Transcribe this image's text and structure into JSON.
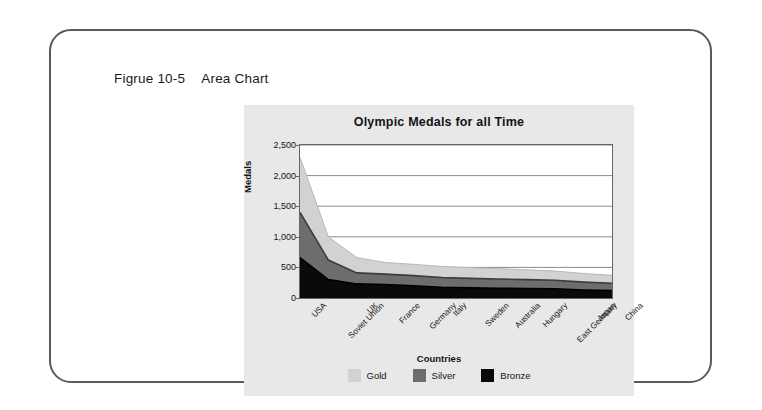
{
  "figure": {
    "caption_number": "Figrue 10-5",
    "caption_text": "Area Chart"
  },
  "colors": {
    "gold": "#d2d2d2",
    "silver": "#6d6d6d",
    "bronze": "#0a0a0a",
    "panel_bg": "#e8e8e8",
    "plot_bg": "#ffffff",
    "axis": "#666666",
    "frame": "#5a5a5a"
  },
  "chart_data": {
    "type": "area",
    "stacked": true,
    "title": "Olympic Medals for all Time",
    "xlabel": "Countries",
    "ylabel": "Medals",
    "ylim": [
      0,
      2500
    ],
    "yticks": [
      0,
      500,
      1000,
      1500,
      2000,
      2500
    ],
    "ytick_labels": [
      "0",
      "500",
      "1,000",
      "1,500",
      "2,000",
      "2,500"
    ],
    "grid": true,
    "legend_position": "bottom",
    "categories": [
      "USA",
      "Soviet Union",
      "UK",
      "France",
      "Germany",
      "Italy",
      "Sweden",
      "Australia",
      "Hungary",
      "East Germany",
      "Japan",
      "China"
    ],
    "series": [
      {
        "name": "Bronze",
        "color": "#0a0a0a",
        "values": [
          660,
          300,
          230,
          220,
          200,
          175,
          165,
          160,
          155,
          150,
          130,
          120
        ]
      },
      {
        "name": "Silver",
        "color": "#6d6d6d",
        "values": [
          740,
          320,
          180,
          170,
          165,
          160,
          155,
          150,
          145,
          140,
          130,
          120
        ]
      },
      {
        "name": "Gold",
        "color": "#d2d2d2",
        "values": [
          900,
          380,
          250,
          190,
          185,
          180,
          175,
          170,
          160,
          150,
          140,
          130
        ]
      }
    ],
    "series_totals": [
      2300,
      1000,
      660,
      580,
      550,
      515,
      495,
      480,
      460,
      440,
      400,
      370
    ]
  }
}
